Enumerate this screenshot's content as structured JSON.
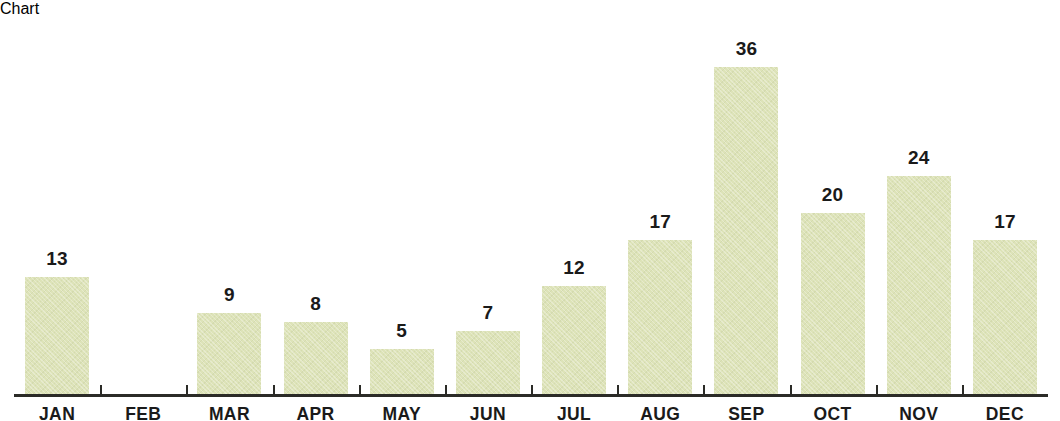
{
  "chart_data": {
    "type": "bar",
    "title": "",
    "subtitle": "",
    "xlabel": "",
    "ylabel": "",
    "categories": [
      "JAN",
      "FEB",
      "MAR",
      "APR",
      "MAY",
      "JUN",
      "JUL",
      "AUG",
      "SEP",
      "OCT",
      "NOV",
      "DEC"
    ],
    "values": [
      13,
      0,
      9,
      8,
      5,
      7,
      12,
      17,
      36,
      20,
      24,
      17
    ],
    "value_labels": [
      "13",
      "",
      "9",
      "8",
      "5",
      "7",
      "12",
      "17",
      "36",
      "20",
      "24",
      "17"
    ],
    "ylim": [
      0,
      36
    ],
    "grid": false,
    "legend": null,
    "annotations": [],
    "colors": {
      "bar_fill": "#dde3b8",
      "axis": "#2b2b27",
      "text": "#1a1a1a",
      "background": "#ffffff"
    }
  }
}
